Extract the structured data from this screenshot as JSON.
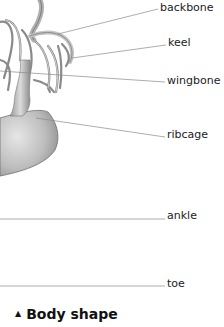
{
  "diagram": {
    "labels": [
      {
        "id": "backbone",
        "text": "backbone"
      },
      {
        "id": "keel",
        "text": "keel"
      },
      {
        "id": "wingbone",
        "text": "wingbone"
      },
      {
        "id": "ribcage",
        "text": "ribcage"
      },
      {
        "id": "ankle",
        "text": "ankle"
      },
      {
        "id": "toe",
        "text": "toe"
      }
    ],
    "leader_color": "#8a8a8a"
  },
  "section": {
    "icon": "triangle-up-icon",
    "icon_glyph": "▲",
    "title": "Body shape"
  }
}
